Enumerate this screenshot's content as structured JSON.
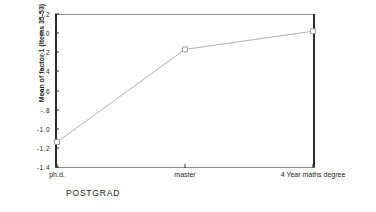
{
  "chart_data": {
    "type": "line",
    "title": "",
    "subtitle": "",
    "xlabel": "POSTGRAD",
    "ylabel": "Mean of factor 1 (Items 35-53)",
    "categories": [
      "ph.d.",
      "master",
      "4 Year maths degree"
    ],
    "values": [
      -1.14,
      -0.17,
      0.02
    ],
    "series": [
      {
        "name": "Mean of factor 1 (Items 35-53)",
        "values": [
          -1.14,
          -0.17,
          0.02
        ]
      }
    ],
    "ylim": [
      -1.4,
      0.2
    ],
    "xlim": [
      0,
      2
    ],
    "yticks": [
      0.2,
      0.0,
      -0.2,
      -0.4,
      -0.6,
      -0.8,
      -1.0,
      -1.2,
      -1.4
    ],
    "ytick_labels": [
      ".2",
      "0.0",
      "-.2",
      "-.4",
      "-.6",
      "-.8",
      "-1.0",
      "-1.2",
      "-1.4"
    ],
    "grid": false,
    "legend": false,
    "legend_position": "none",
    "marker": "open-square",
    "line_color": "#a6a6a6",
    "marker_color": "#8c8c8c",
    "axis_color": "#2b2b2b",
    "background_color": "#ffffff"
  }
}
